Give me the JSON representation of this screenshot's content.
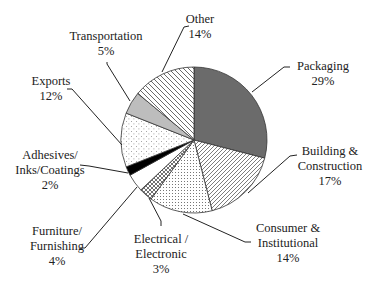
{
  "chart_data": {
    "type": "pie",
    "title": "",
    "start_angle_deg": 0,
    "direction": "clockwise",
    "slices": [
      {
        "label": "Packaging",
        "value": 29,
        "display": [
          "Packaging",
          "29%"
        ],
        "fill": "dark-gray",
        "color": "#6b6b6b",
        "pattern": "solid"
      },
      {
        "label": "Building & Construction",
        "value": 17,
        "display": [
          "Building &",
          "Construction",
          "17%"
        ],
        "fill": "diagonal-lines",
        "color": "#ffffff",
        "pattern": "diag-fwd"
      },
      {
        "label": "Consumer & Institutional",
        "value": 14,
        "display": [
          "Consumer &",
          "Institutional",
          "14%"
        ],
        "fill": "dense-dots",
        "color": "#ffffff",
        "pattern": "dots-dense"
      },
      {
        "label": "Electrical / Electronic",
        "value": 3,
        "display": [
          "Electrical /",
          "Electronic",
          "3%"
        ],
        "fill": "crosshatch",
        "color": "#ffffff",
        "pattern": "crosshatch"
      },
      {
        "label": "Furniture/ Furnishing",
        "value": 4,
        "display": [
          "Furniture/",
          "Furnishing",
          "4%"
        ],
        "fill": "white",
        "color": "#ffffff",
        "pattern": "solid"
      },
      {
        "label": "Adhesives/ Inks/Coatings",
        "value": 2,
        "display": [
          "Adhesives/",
          "Inks/Coatings",
          "2%"
        ],
        "fill": "black",
        "color": "#000000",
        "pattern": "solid"
      },
      {
        "label": "Exports",
        "value": 12,
        "display": [
          "Exports",
          "12%"
        ],
        "fill": "sparse-dots",
        "color": "#ffffff",
        "pattern": "dots-sparse"
      },
      {
        "label": "Transportation",
        "value": 5,
        "display": [
          "Transportation",
          "5%"
        ],
        "fill": "light-gray",
        "color": "#bdbdbd",
        "pattern": "solid"
      },
      {
        "label": "Other",
        "value": 14,
        "display": [
          "Other",
          "14%"
        ],
        "fill": "wide-diagonal-lines",
        "color": "#ffffff",
        "pattern": "diag-back"
      }
    ],
    "legend": "none",
    "labels_position": "outside-with-leader-lines"
  },
  "layout": {
    "center": [
      194,
      140
    ],
    "radius": 73,
    "labels": [
      {
        "x": 323,
        "y": 70,
        "anchor": "middle",
        "leader": [
          [
            290,
            67
          ],
          [
            284,
            67
          ],
          [
            252,
            92
          ]
        ]
      },
      {
        "x": 330,
        "y": 155,
        "anchor": "middle",
        "leader": [
          [
            297,
            155
          ],
          [
            290,
            156
          ],
          [
            248,
            193
          ]
        ]
      },
      {
        "x": 288,
        "y": 232,
        "anchor": "middle",
        "leader": [
          [
            251,
            242
          ],
          [
            245,
            242
          ],
          [
            183,
            214
          ]
        ]
      },
      {
        "x": 161,
        "y": 243,
        "anchor": "middle",
        "leader": [
          [
            161,
            226
          ],
          [
            161,
            221
          ],
          [
            149,
            198
          ]
        ]
      },
      {
        "x": 57,
        "y": 235,
        "anchor": "middle",
        "leader": [
          [
            80,
            248
          ],
          [
            85,
            248
          ],
          [
            137,
            187
          ]
        ]
      },
      {
        "x": 50,
        "y": 159,
        "anchor": "middle",
        "leader": [
          [
            80,
            165
          ],
          [
            89,
            166
          ],
          [
            128,
            173
          ]
        ]
      },
      {
        "x": 51,
        "y": 85,
        "anchor": "middle",
        "leader": [
          [
            67,
            89
          ],
          [
            72,
            89
          ],
          [
            122,
            145
          ]
        ]
      },
      {
        "x": 106,
        "y": 40,
        "anchor": "middle",
        "leader": [
          [
            107,
            62
          ],
          [
            107,
            64
          ],
          [
            130,
            101
          ]
        ]
      },
      {
        "x": 200,
        "y": 23,
        "anchor": "middle",
        "leader": [
          [
            189,
            26
          ],
          [
            184,
            27
          ],
          [
            162,
            72
          ]
        ]
      }
    ]
  }
}
